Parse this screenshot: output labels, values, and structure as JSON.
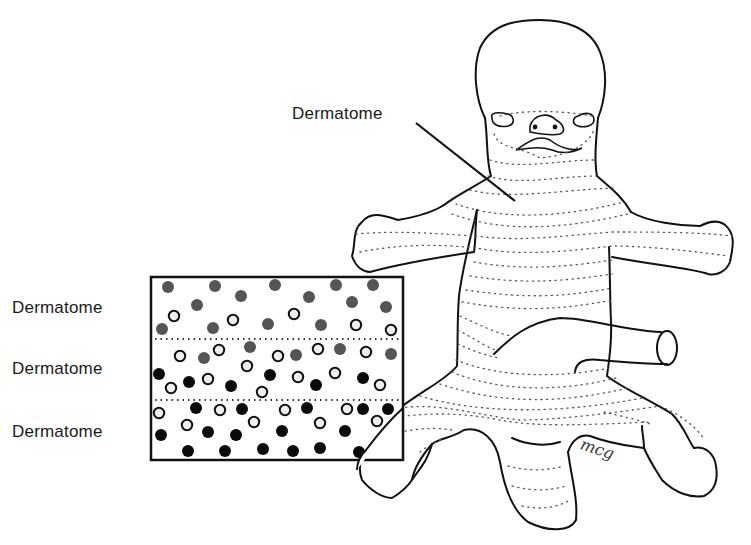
{
  "figure": {
    "type": "anatomical-diagram",
    "signature": "mcg"
  },
  "labels": {
    "main": "Dermatome",
    "inset_rows": [
      "Dermatome",
      "Dermatome",
      "Dermatome"
    ]
  },
  "colors": {
    "outline": "#111111",
    "gray_dot": "#555555",
    "black_dot": "#0a0a0a",
    "open_dot_fill": "#eeeeee",
    "dotted_line": "#555555"
  },
  "inset": {
    "x": 151,
    "y": 277,
    "width": 252,
    "height": 183,
    "separators_y": [
      339,
      400
    ],
    "dots": [
      {
        "x": 168,
        "y": 287,
        "t": "g"
      },
      {
        "x": 215,
        "y": 286,
        "t": "g"
      },
      {
        "x": 275,
        "y": 285,
        "t": "g"
      },
      {
        "x": 336,
        "y": 285,
        "t": "g"
      },
      {
        "x": 373,
        "y": 285,
        "t": "g"
      },
      {
        "x": 197,
        "y": 305,
        "t": "g"
      },
      {
        "x": 241,
        "y": 296,
        "t": "g"
      },
      {
        "x": 309,
        "y": 297,
        "t": "g"
      },
      {
        "x": 352,
        "y": 302,
        "t": "g"
      },
      {
        "x": 386,
        "y": 307,
        "t": "g"
      },
      {
        "x": 174,
        "y": 316,
        "t": "o"
      },
      {
        "x": 233,
        "y": 320,
        "t": "o"
      },
      {
        "x": 294,
        "y": 314,
        "t": "o"
      },
      {
        "x": 356,
        "y": 325,
        "t": "o"
      },
      {
        "x": 391,
        "y": 330,
        "t": "o"
      },
      {
        "x": 162,
        "y": 329,
        "t": "g"
      },
      {
        "x": 213,
        "y": 328,
        "t": "g"
      },
      {
        "x": 268,
        "y": 324,
        "t": "g"
      },
      {
        "x": 321,
        "y": 325,
        "t": "g"
      },
      {
        "x": 180,
        "y": 356,
        "t": "o"
      },
      {
        "x": 219,
        "y": 350,
        "t": "o"
      },
      {
        "x": 278,
        "y": 356,
        "t": "o"
      },
      {
        "x": 318,
        "y": 349,
        "t": "o"
      },
      {
        "x": 366,
        "y": 352,
        "t": "o"
      },
      {
        "x": 204,
        "y": 358,
        "t": "g"
      },
      {
        "x": 250,
        "y": 347,
        "t": "g"
      },
      {
        "x": 296,
        "y": 355,
        "t": "g"
      },
      {
        "x": 340,
        "y": 349,
        "t": "g"
      },
      {
        "x": 391,
        "y": 354,
        "t": "g"
      },
      {
        "x": 247,
        "y": 366,
        "t": "o"
      },
      {
        "x": 298,
        "y": 377,
        "t": "o"
      },
      {
        "x": 335,
        "y": 373,
        "t": "o"
      },
      {
        "x": 159,
        "y": 374,
        "t": "b"
      },
      {
        "x": 189,
        "y": 382,
        "t": "b"
      },
      {
        "x": 231,
        "y": 386,
        "t": "b"
      },
      {
        "x": 270,
        "y": 375,
        "t": "b"
      },
      {
        "x": 316,
        "y": 385,
        "t": "b"
      },
      {
        "x": 363,
        "y": 378,
        "t": "b"
      },
      {
        "x": 171,
        "y": 388,
        "t": "o"
      },
      {
        "x": 208,
        "y": 379,
        "t": "o"
      },
      {
        "x": 262,
        "y": 392,
        "t": "o"
      },
      {
        "x": 380,
        "y": 385,
        "t": "o"
      },
      {
        "x": 159,
        "y": 413,
        "t": "o"
      },
      {
        "x": 220,
        "y": 410,
        "t": "o"
      },
      {
        "x": 285,
        "y": 410,
        "t": "o"
      },
      {
        "x": 347,
        "y": 409,
        "t": "o"
      },
      {
        "x": 377,
        "y": 421,
        "t": "o"
      },
      {
        "x": 196,
        "y": 408,
        "t": "b"
      },
      {
        "x": 242,
        "y": 409,
        "t": "b"
      },
      {
        "x": 307,
        "y": 408,
        "t": "b"
      },
      {
        "x": 363,
        "y": 409,
        "t": "b"
      },
      {
        "x": 388,
        "y": 409,
        "t": "b"
      },
      {
        "x": 187,
        "y": 425,
        "t": "o"
      },
      {
        "x": 254,
        "y": 422,
        "t": "o"
      },
      {
        "x": 320,
        "y": 423,
        "t": "o"
      },
      {
        "x": 161,
        "y": 435,
        "t": "b"
      },
      {
        "x": 208,
        "y": 432,
        "t": "b"
      },
      {
        "x": 236,
        "y": 435,
        "t": "b"
      },
      {
        "x": 282,
        "y": 431,
        "t": "b"
      },
      {
        "x": 345,
        "y": 431,
        "t": "b"
      },
      {
        "x": 188,
        "y": 451,
        "t": "b"
      },
      {
        "x": 225,
        "y": 451,
        "t": "b"
      },
      {
        "x": 263,
        "y": 449,
        "t": "b"
      },
      {
        "x": 293,
        "y": 451,
        "t": "b"
      },
      {
        "x": 320,
        "y": 448,
        "t": "b"
      },
      {
        "x": 359,
        "y": 452,
        "t": "b"
      }
    ]
  }
}
